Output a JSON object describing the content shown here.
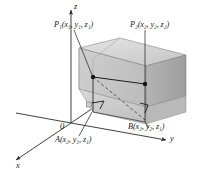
{
  "figure": {
    "background_color": "#ffffff",
    "line_color": "#262626",
    "colors": {
      "face_top": "#d5d5d5",
      "face_front_left": "#c6c6c6",
      "face_front_right": "#bdbdbd",
      "face_right_side": "#a9a9a9",
      "face_lower": "#cfcfcf",
      "edge": "#4a4a4a",
      "axis": "#2b2b2b",
      "point": "#1a1a1a"
    }
  },
  "axes": {
    "x": {
      "label": "x"
    },
    "y": {
      "label": "y"
    },
    "z": {
      "label": "z"
    },
    "origin": {
      "label": "0"
    }
  },
  "points": {
    "p1": {
      "name": "P",
      "index": "1",
      "coords": [
        "x",
        "y",
        "z"
      ],
      "coord_subs": [
        "1",
        "1",
        "1"
      ],
      "label_full": "P₁(x₁, y₁, z₁)"
    },
    "p2": {
      "name": "P",
      "index": "2",
      "coords": [
        "x",
        "y",
        "z"
      ],
      "coord_subs": [
        "2",
        "2",
        "2"
      ],
      "label_full": "P₂(x₂, y₂, z₂)"
    },
    "a": {
      "name": "A",
      "coords": [
        "x",
        "y",
        "z"
      ],
      "coord_subs": [
        "2",
        "1",
        "1"
      ],
      "label_full": "A(x₂, y₁, z₁)"
    },
    "b": {
      "name": "B",
      "coords": [
        "x",
        "y",
        "z"
      ],
      "coord_subs": [
        "2",
        "2",
        "1"
      ],
      "label_full": "B(x₂, y₂, z₁)"
    }
  },
  "markers": {
    "right_angle_left": "right-angle",
    "right_angle_right": "right-angle"
  }
}
